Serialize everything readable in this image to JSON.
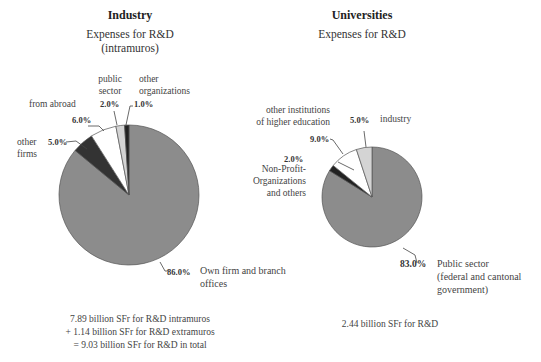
{
  "chart_data": [
    {
      "type": "pie",
      "title": "Industry",
      "subtitle": "Expenses for R&D (intramuros)",
      "slices": [
        {
          "label": "Own firm and branch offices",
          "value": 86.0,
          "color": "#8c8c8c"
        },
        {
          "label": "other firms",
          "value": 5.0,
          "color": "#333333"
        },
        {
          "label": "from abroad",
          "value": 6.0,
          "color": "#ffffff"
        },
        {
          "label": "public sector",
          "value": 2.0,
          "color": "#d4d4d4"
        },
        {
          "label": "other organizations",
          "value": 1.0,
          "color": "#222222"
        }
      ],
      "footnote": [
        "7.89 billion SFr for R&D intramuros",
        "+ 1.14 billion SFr for R&D extramuros",
        "= 9.03 billion SFr for R&D in total"
      ]
    },
    {
      "type": "pie",
      "title": "Universities",
      "subtitle": "Expenses for R&D",
      "slices": [
        {
          "label": "Public sector (federal and cantonal government)",
          "value": 83.0,
          "color": "#8c8c8c"
        },
        {
          "label": "Non-Profit-Organizations and others",
          "value": 2.0,
          "color": "#222222"
        },
        {
          "label": "other institutions of higher education",
          "value": 9.0,
          "color": "#ffffff"
        },
        {
          "label": "industry",
          "value": 5.0,
          "color": "#d4d4d4"
        }
      ],
      "footnote": [
        "2.44 billion SFr for R&D"
      ]
    }
  ],
  "industry": {
    "title": "Industry",
    "subtitle1": "Expenses for R&D",
    "subtitle2": "(intramuros)",
    "pct_own": "86.0%",
    "lbl_own1": "Own firm and branch",
    "lbl_own2": "offices",
    "pct_firms": "5.0%",
    "lbl_firms1": "other",
    "lbl_firms2": "firms",
    "pct_abroad": "6.0%",
    "lbl_abroad": "from abroad",
    "pct_public": "2.0%",
    "lbl_public1": "public",
    "lbl_public2": "sector",
    "pct_other": "1.0%",
    "lbl_other1": "other",
    "lbl_other2": "organizations",
    "note1": "7.89 billion SFr for R&D intramuros",
    "note2": "+ 1.14 billion SFr for R&D extramuros",
    "note3": "= 9.03 billion SFr for R&D in total"
  },
  "universities": {
    "title": "Universities",
    "subtitle": "Expenses for R&D",
    "pct_public": "83.0%",
    "lbl_public1": "Public sector",
    "lbl_public2": "(federal and cantonal",
    "lbl_public3": "government)",
    "pct_npo": "2.0%",
    "lbl_npo1": "Non-Profit-",
    "lbl_npo2": "Organizations",
    "lbl_npo3": "and others",
    "pct_higher": "9.0%",
    "lbl_higher1": "other institutions",
    "lbl_higher2": "of higher education",
    "pct_industry": "5.0%",
    "lbl_industry": "industry",
    "note": "2.44 billion SFr for R&D"
  }
}
